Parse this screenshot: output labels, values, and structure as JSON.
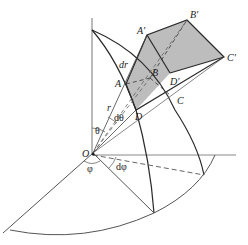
{
  "diagram": {
    "colors": {
      "stroke": "#2a2a2a",
      "axis": "#777777",
      "fill": "#bdbdbd",
      "background": "#ffffff"
    },
    "labels": {
      "origin": "O",
      "A": "A",
      "B": "B",
      "C": "C",
      "D": "D",
      "A_prime": "A'",
      "B_prime": "B'",
      "C_prime": "C'",
      "D_prime": "D'",
      "r": "r",
      "dr": "dr",
      "theta": "θ",
      "dtheta": "dθ",
      "phi": "φ",
      "dphi": "dφ"
    }
  }
}
